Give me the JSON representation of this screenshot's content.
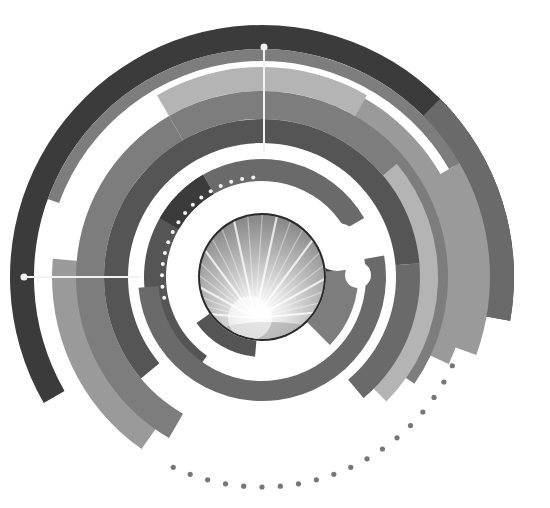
{
  "graphic": {
    "description": "Abstract grayscale concentric arc design with central glowing sphere",
    "palette": {
      "background": "#ffffff",
      "darkest": "#3b3b3b",
      "dark": "#555555",
      "mid_dark": "#6a6a6a",
      "mid": "#7d7d7d",
      "mid_light": "#9a9a9a",
      "light": "#b4b4b4",
      "white": "#ffffff",
      "dot_gray": "#777777"
    },
    "elements": {
      "central_sphere": "glowing-light-rays-sphere",
      "pointer_lines": 2,
      "inner_dot_ring_count": 16,
      "outer_dot_arc_count": 19
    }
  }
}
